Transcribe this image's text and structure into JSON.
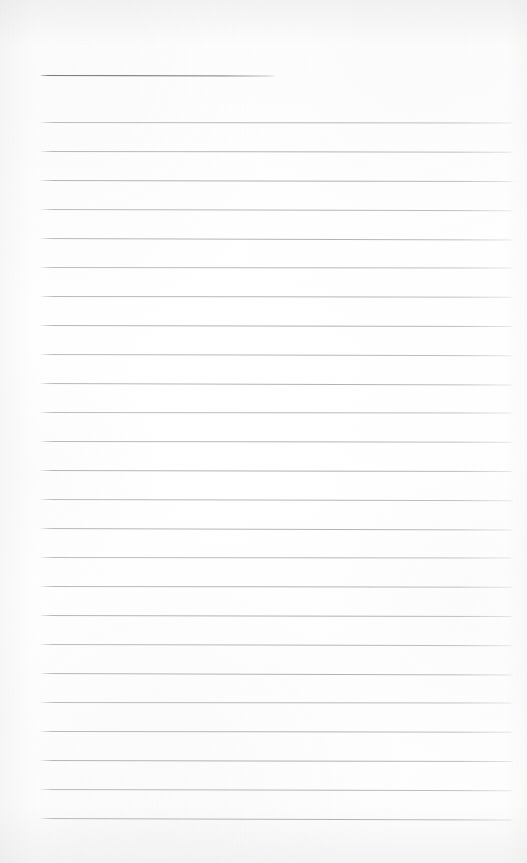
{
  "page": {
    "kind": "scanned-ruled-notepad-page",
    "width": 527,
    "height": 863,
    "background_color": "#fdfdfc",
    "content_text": ""
  },
  "colors": {
    "paper": "#fdfdfc",
    "title_rule": "#6a6d72",
    "body_rule": "#b0b4b9",
    "edge_shading": "#babcbe"
  },
  "rules": {
    "title_rule": {
      "label": "title-underline",
      "y": 75,
      "x_start": 41,
      "x_end": 277,
      "thickness": 1.4,
      "color": "#6a6d72"
    },
    "body_rule_geometry": {
      "x_start": 41,
      "x_end": 514,
      "first_y": 122,
      "spacing": 29,
      "count": 25,
      "thickness": 1,
      "color": "#b0b4b9",
      "tilt_degrees": 0.12
    },
    "body_rule_y_values": [
      122,
      151,
      180,
      209,
      238,
      267,
      296,
      325,
      354,
      383,
      412,
      441,
      470,
      499,
      528,
      557,
      586,
      615,
      644,
      673,
      702,
      731,
      760,
      789,
      818
    ]
  }
}
